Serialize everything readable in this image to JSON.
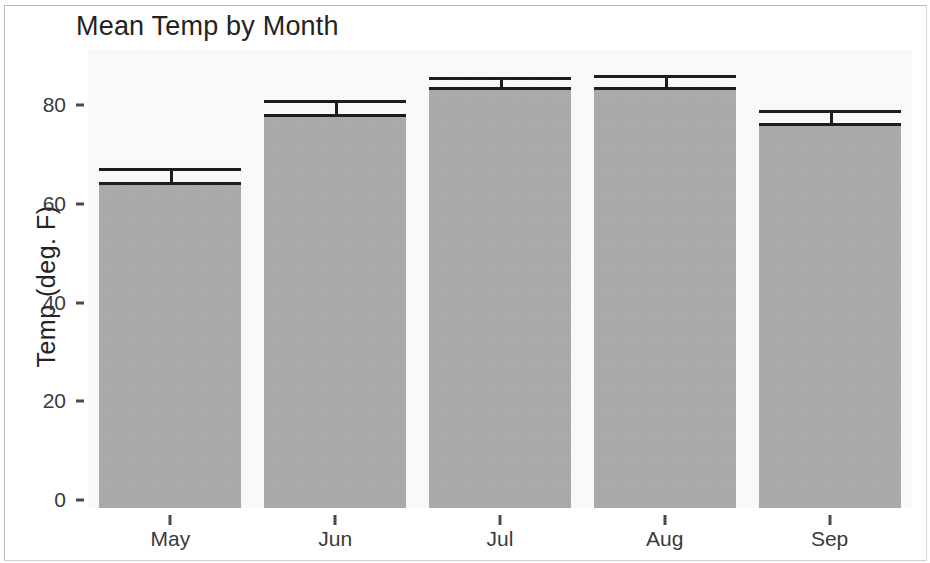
{
  "chart_data": {
    "type": "bar",
    "title": "Mean Temp by Month",
    "xlabel": "",
    "ylabel": "Temp (deg. F)",
    "categories": [
      "May",
      "Jun",
      "Jul",
      "Aug",
      "Sep"
    ],
    "values": [
      64.4,
      78.1,
      83.6,
      83.6,
      76.3
    ],
    "error_upper": [
      67.2,
      81.0,
      85.6,
      86.0,
      78.9
    ],
    "series": [
      {
        "name": "Mean Temp",
        "values": [
          64.4,
          78.1,
          83.6,
          83.6,
          76.3
        ]
      }
    ],
    "ylim": [
      0,
      88
    ],
    "yticks": [
      0,
      20,
      40,
      60,
      80
    ],
    "ytick_labels": [
      "0",
      "20",
      "40",
      "60",
      "80"
    ],
    "grid": false,
    "legend": "none",
    "bar_color": "#ababab",
    "bar_outline_color": "#1d1d1d",
    "panel_color": "#fbfbfb",
    "text_color": "#232323",
    "error_bar_note": "upper error bar cap only, no lower cap visible"
  },
  "axis": {
    "y_title": "Temp (deg. F)"
  }
}
